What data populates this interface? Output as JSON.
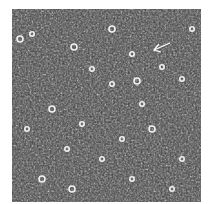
{
  "image": {
    "type": "grayscale phase-contrast micrograph",
    "description": "Dense field of cells with scattered bright round cells",
    "annotation": {
      "type": "arrow",
      "pointing": "left",
      "color": "#ffffff"
    },
    "colors": {
      "background": "#3a3a3a",
      "highlight": "#e8e8e8",
      "page": "#ffffff"
    }
  }
}
